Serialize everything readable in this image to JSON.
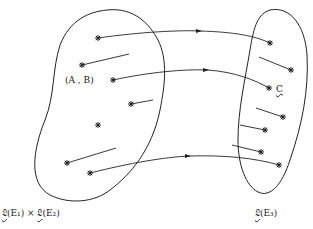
{
  "diagram": {
    "type": "mapping",
    "left_set": {
      "label_prefix": "𝔏",
      "label": "(E₁) × ",
      "label_prefix2": "𝔏",
      "label2": "(E₂)",
      "element_label": "(A , B)",
      "points": [
        [
          98,
          38
        ],
        [
          82,
          65
        ],
        [
          113,
          80
        ],
        [
          131,
          104
        ],
        [
          98,
          125
        ],
        [
          67,
          163
        ],
        [
          90,
          173
        ]
      ]
    },
    "right_set": {
      "label_prefix": "𝔏",
      "label": "(E₃)",
      "element_label": "C",
      "points": [
        [
          270,
          43
        ],
        [
          291,
          70
        ],
        [
          269,
          88
        ],
        [
          283,
          117
        ],
        [
          265,
          130
        ],
        [
          261,
          152
        ],
        [
          279,
          165
        ]
      ]
    },
    "arrows": [
      {
        "from": [
          98,
          38
        ],
        "to": [
          270,
          43
        ]
      },
      {
        "from": [
          113,
          80
        ],
        "to": [
          269,
          88
        ]
      },
      {
        "from": [
          90,
          173
        ],
        "to": [
          279,
          165
        ]
      }
    ],
    "colors": {
      "stroke": "#222222",
      "background": "#ffffff"
    }
  }
}
